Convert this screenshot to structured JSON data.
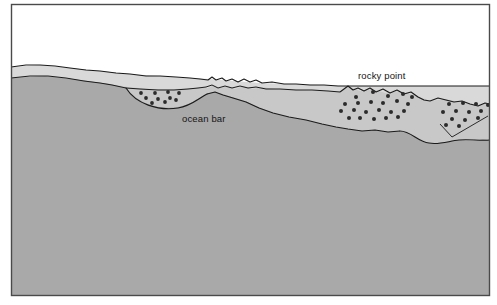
{
  "figure": {
    "name": "coastal-cross-section",
    "type": "geological-profile-diagram",
    "frame": {
      "border_color": "#4a4a4a",
      "border_width_px": 1,
      "x": 11,
      "y": 4,
      "width": 479,
      "height": 292
    },
    "palette": {
      "sky_white": "#ffffff",
      "shallow_water_light_gray": "#d9d9d9",
      "submerged_bank_mid_gray": "#c8c8c8",
      "bedrock_dark_gray": "#a9a9a9",
      "outline_black": "#1a1a1a",
      "rock_dot_color": "#2b2b2b",
      "label_color": "#151515"
    },
    "labels": [
      {
        "id": "ocean-bar-label",
        "text": "ocean bar",
        "x": 182,
        "y": 122,
        "anchor": "start"
      },
      {
        "id": "rocky-point-label",
        "text": "rocky point",
        "x": 358,
        "y": 79,
        "anchor": "start"
      }
    ],
    "regions": [
      {
        "id": "sky",
        "label": "sky / air above water",
        "fill": "#ffffff"
      },
      {
        "id": "water-layer",
        "label": "water column",
        "fill": "#d9d9d9"
      },
      {
        "id": "submerged-slope",
        "label": "submerged sand slope",
        "fill": "#c8c8c8"
      },
      {
        "id": "bedrock",
        "label": "bedrock substrate",
        "fill": "#a9a9a9"
      }
    ],
    "rock_clusters": [
      {
        "id": "ocean-bar-rocks",
        "label": "ocean bar cobble deposit",
        "dot_radius": 1.9,
        "dots": [
          [
            141,
            93
          ],
          [
            155,
            93
          ],
          [
            168,
            92
          ],
          [
            179,
            93
          ],
          [
            146,
            98
          ],
          [
            158,
            99
          ],
          [
            170,
            98
          ],
          [
            152,
            103
          ],
          [
            165,
            102
          ],
          [
            175,
            100
          ]
        ]
      },
      {
        "id": "rocky-point-rocks",
        "label": "rocky point cobble deposit",
        "dot_radius": 2.0,
        "dots": [
          [
            356,
            97
          ],
          [
            373,
            92
          ],
          [
            388,
            96
          ],
          [
            403,
            94
          ],
          [
            412,
            97
          ],
          [
            345,
            104
          ],
          [
            358,
            103
          ],
          [
            371,
            102
          ],
          [
            383,
            103
          ],
          [
            397,
            101
          ],
          [
            408,
            104
          ],
          [
            341,
            111
          ],
          [
            354,
            110
          ],
          [
            366,
            112
          ],
          [
            379,
            110
          ],
          [
            391,
            112
          ],
          [
            404,
            111
          ],
          [
            349,
            118
          ],
          [
            360,
            118
          ],
          [
            374,
            119
          ],
          [
            386,
            118
          ],
          [
            398,
            117
          ]
        ]
      },
      {
        "id": "right-shoal-rocks",
        "label": "right-hand shoal cobble deposit",
        "dot_radius": 2.0,
        "dots": [
          [
            449,
            104
          ],
          [
            463,
            103
          ],
          [
            476,
            104
          ],
          [
            488,
            105
          ],
          [
            443,
            112
          ],
          [
            456,
            111
          ],
          [
            469,
            112
          ],
          [
            481,
            111
          ],
          [
            452,
            119
          ],
          [
            465,
            120
          ],
          [
            478,
            118
          ],
          [
            446,
            125
          ],
          [
            459,
            126
          ]
        ]
      }
    ]
  }
}
